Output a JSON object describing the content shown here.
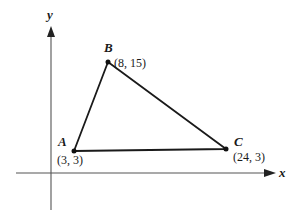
{
  "axes": {
    "x_label": "x",
    "y_label": "y"
  },
  "points": [
    {
      "name": "A",
      "coord": "(3, 3)",
      "x": 3,
      "y": 3
    },
    {
      "name": "B",
      "coord": "(8, 15)",
      "x": 8,
      "y": 15
    },
    {
      "name": "C",
      "coord": "(24, 3)",
      "x": 24,
      "y": 3
    }
  ],
  "colors": {
    "line": "#1a1a1a",
    "axis": "#555555",
    "background": "#ffffff"
  }
}
